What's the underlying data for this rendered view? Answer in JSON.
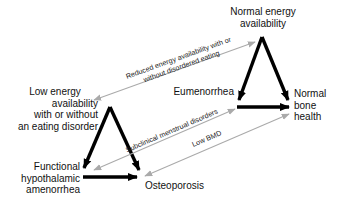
{
  "diagram": {
    "nodes": {
      "normal_energy": "Normal energy\navailability",
      "normal_energy_l1": "Normal energy",
      "normal_energy_l2": "availability",
      "low_energy_l1": "Low energy",
      "low_energy_l2": "availability",
      "low_energy_l3": "with or without",
      "low_energy_l4": "an eating disorder",
      "eumenorrhea": "Eumenorrhea",
      "normal_bone_l1": "Normal",
      "normal_bone_l2": "bone",
      "normal_bone_l3": "health",
      "fha_l1": "Functional",
      "fha_l2": "hypothalamic",
      "fha_l3": "amenorrhea",
      "osteoporosis": "Osteoporosis"
    },
    "continuum_labels": {
      "energy_l1": "Reduced energy availability with or",
      "energy_l2": "without disordered eating",
      "menstrual": "Subclinical menstrual disorders",
      "bone": "Low BMD"
    },
    "colors": {
      "main_arrow": "#000000",
      "continuum_arrow": "#aaaaaa",
      "text": "#111111"
    }
  }
}
